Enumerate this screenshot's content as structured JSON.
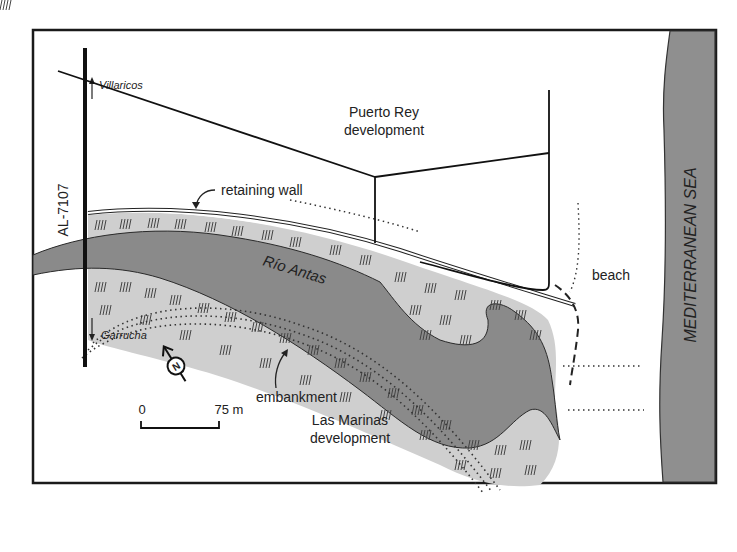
{
  "map": {
    "labels": {
      "road": "AL-7107",
      "north_town": "Villaricos",
      "south_town": "Garrucha",
      "development_top_line1": "Puerto Rey",
      "development_top_line2": "development",
      "retaining_wall": "retaining wall",
      "river": "Río Antas",
      "beach": "beach",
      "sea": "MEDITERRANEAN SEA",
      "embankment": "embankment",
      "development_bottom_line1": "Las Marinas",
      "development_bottom_line2": "development",
      "compass": "N"
    },
    "scale_bar": {
      "start_label": "0",
      "end_label": "75 m"
    },
    "colors": {
      "frame": "#1a1a1a",
      "sea": "#8f8f8f",
      "river": "#8a8a8a",
      "marsh": "#cfcfcf",
      "ink": "#222222",
      "background": "#ffffff"
    }
  }
}
